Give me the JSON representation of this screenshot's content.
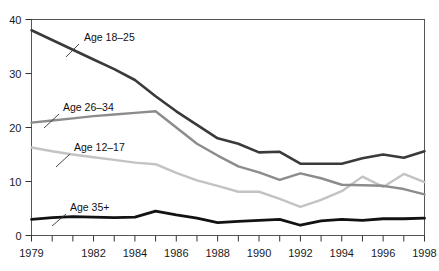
{
  "chart_data": {
    "type": "line",
    "title": "",
    "subtitle": "",
    "xlabel": "",
    "ylabel": "",
    "x": [
      1979,
      1980,
      1981,
      1982,
      1983,
      1984,
      1985,
      1986,
      1987,
      1988,
      1989,
      1990,
      1991,
      1992,
      1993,
      1994,
      1995,
      1996,
      1997,
      1998
    ],
    "xlim": [
      1979,
      1998
    ],
    "ylim": [
      0,
      40
    ],
    "yticks": [
      0,
      10,
      20,
      30,
      40
    ],
    "ytick_labels": [
      "0",
      "10",
      "20",
      "30",
      "40"
    ],
    "xticks": [
      1979,
      1980,
      1981,
      1982,
      1983,
      1984,
      1985,
      1986,
      1987,
      1988,
      1989,
      1990,
      1991,
      1992,
      1993,
      1994,
      1995,
      1996,
      1997,
      1998
    ],
    "xtick_labels": [
      "1979",
      "",
      "",
      "1982",
      "",
      "1984",
      "",
      "1986",
      "",
      "1988",
      "",
      "1990",
      "",
      "1992",
      "",
      "1994",
      "",
      "1996",
      "",
      "1998"
    ],
    "grid": false,
    "legend_position": "inline-annotations",
    "series": [
      {
        "name": "Age 18-25",
        "label": "Age 18–25",
        "color": "#3a3a3a",
        "width": 2.6,
        "values": [
          38.0,
          36.2,
          34.4,
          32.6,
          30.8,
          28.8,
          25.8,
          23.0,
          20.5,
          18.0,
          17.0,
          15.4,
          15.5,
          13.3,
          13.3,
          13.3,
          14.3,
          15.0,
          14.4,
          15.6
        ]
      },
      {
        "name": "Age 26-34",
        "label": "Age 26–34",
        "color": "#8c8c8c",
        "width": 2.4,
        "values": [
          20.9,
          21.3,
          21.7,
          22.1,
          22.4,
          22.7,
          23.0,
          20.0,
          17.0,
          14.8,
          12.8,
          11.7,
          10.3,
          11.5,
          10.6,
          9.4,
          9.3,
          9.2,
          8.6,
          7.6
        ]
      },
      {
        "name": "Age 12-17",
        "label": "Age 12–17",
        "color": "#c3c3c3",
        "width": 2.4,
        "values": [
          16.3,
          15.6,
          15.0,
          14.5,
          14.0,
          13.5,
          13.2,
          11.6,
          10.2,
          9.2,
          8.1,
          8.1,
          6.8,
          5.3,
          6.6,
          8.2,
          10.9,
          9.0,
          11.4,
          9.9
        ]
      },
      {
        "name": "Age 35+",
        "label": "Age 35+",
        "color": "#121212",
        "width": 2.8,
        "values": [
          3.0,
          3.3,
          3.5,
          3.4,
          3.3,
          3.4,
          4.5,
          3.8,
          3.2,
          2.4,
          2.6,
          2.8,
          3.0,
          1.9,
          2.7,
          3.0,
          2.8,
          3.1,
          3.1,
          3.2
        ]
      }
    ],
    "annotations": [
      {
        "name": "annotation-age-18-25",
        "text": "Age 18–25",
        "text_x": 84,
        "text_y": 41,
        "leader": [
          [
            79,
            44
          ],
          [
            66,
            57
          ]
        ]
      },
      {
        "name": "annotation-age-26-34",
        "text": "Age 26–34",
        "text_x": 63,
        "text_y": 111,
        "leader": [
          [
            59,
            114
          ],
          [
            44,
            128
          ]
        ]
      },
      {
        "name": "annotation-age-12-17",
        "text": "Age 12–17",
        "text_x": 74,
        "text_y": 151,
        "leader": [
          [
            70,
            154
          ],
          [
            56,
            167
          ]
        ]
      },
      {
        "name": "annotation-age-35-plus",
        "text": "Age 35+",
        "text_x": 70,
        "text_y": 211,
        "leader": [
          [
            66,
            214
          ],
          [
            52,
            226
          ]
        ]
      }
    ],
    "axis_color": "#555555",
    "frame": {
      "top": true,
      "right": true,
      "bottom": true,
      "left": true
    }
  }
}
